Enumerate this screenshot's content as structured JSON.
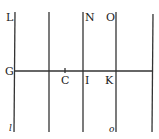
{
  "diagram": {
    "labels": {
      "L": "L",
      "N": "N",
      "O": "O",
      "G": "G",
      "C": "C",
      "I": "I",
      "K": "K",
      "l": "l",
      "o": "o"
    },
    "vertical_lines_x": [
      15,
      49,
      83,
      116,
      153
    ],
    "horizontal_line_y": 71,
    "line_color": "#333333"
  }
}
